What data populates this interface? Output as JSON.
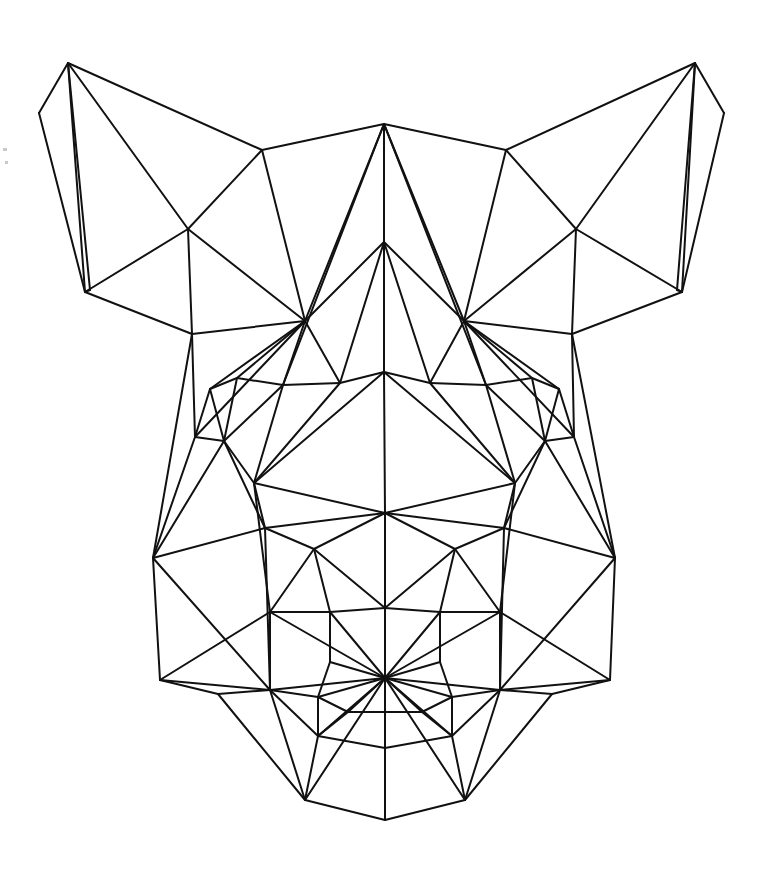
{
  "artwork": {
    "title": "Geometric Low-Poly Animal Head",
    "subject": "fox-dog-head",
    "style": "triangulated-line-art",
    "canvas": {
      "width": 757,
      "height": 884
    },
    "background_color": "#ffffff",
    "stroke_color": "#111111",
    "stroke_width": 2,
    "symmetry": "bilateral-vertical",
    "symmetry_axis_x": 384
  },
  "geometry": {
    "vertices": {
      "ear_l_tip": [
        68,
        63
      ],
      "ear_l_out_low": [
        39,
        113
      ],
      "ear_l_bottom": [
        85,
        292
      ],
      "ear_l_inner": [
        188,
        229
      ],
      "ear_l_base_in": [
        192,
        334
      ],
      "ear_l_fold": [
        90,
        290
      ],
      "ear_r_tip": [
        695,
        63
      ],
      "ear_r_out_low": [
        724,
        113
      ],
      "ear_r_bottom": [
        682,
        292
      ],
      "ear_r_inner": [
        576,
        229
      ],
      "ear_r_base_in": [
        572,
        334
      ],
      "ear_r_fold": [
        677,
        290
      ],
      "crown_top": [
        384,
        124
      ],
      "crown_l": [
        262,
        150
      ],
      "crown_r": [
        506,
        150
      ],
      "brow_l_hub": [
        305,
        321
      ],
      "brow_r_hub": [
        464,
        321
      ],
      "bridge_top": [
        384,
        242
      ],
      "bridge_mid": [
        384,
        372
      ],
      "brow_l_in": [
        340,
        383
      ],
      "brow_r_in": [
        430,
        383
      ],
      "eye_l_top": [
        237,
        378
      ],
      "eye_l_out": [
        210,
        389
      ],
      "eye_l_in": [
        283,
        385
      ],
      "eye_l_low": [
        224,
        441
      ],
      "eye_r_top": [
        532,
        378
      ],
      "eye_r_out": [
        559,
        389
      ],
      "eye_r_in": [
        486,
        385
      ],
      "eye_r_low": [
        545,
        441
      ],
      "cheek_l_up": [
        195,
        437
      ],
      "cheek_r_up": [
        574,
        437
      ],
      "cheek_l_mid": [
        254,
        483
      ],
      "cheek_r_mid": [
        515,
        483
      ],
      "jaw_l_corner": [
        153,
        558
      ],
      "jaw_r_corner": [
        615,
        558
      ],
      "muzzle_l_up": [
        265,
        528
      ],
      "muzzle_r_up": [
        504,
        528
      ],
      "face_center": [
        385,
        513
      ],
      "cheek_l_low": [
        314,
        549
      ],
      "cheek_r_low": [
        455,
        549
      ],
      "muzzle_l": [
        270,
        612
      ],
      "muzzle_r": [
        500,
        612
      ],
      "muzzle_l_hub": [
        270,
        690
      ],
      "muzzle_r_hub": [
        500,
        690
      ],
      "snout_l_up": [
        330,
        612
      ],
      "snout_r_up": [
        440,
        612
      ],
      "snout_l": [
        330,
        662
      ],
      "snout_r": [
        440,
        662
      ],
      "nose_hub": [
        385,
        678
      ],
      "nose_l_wing": [
        318,
        697
      ],
      "nose_r_wing": [
        452,
        697
      ],
      "nose_top": [
        385,
        608
      ],
      "jaw_l_low": [
        160,
        680
      ],
      "jaw_r_low": [
        610,
        680
      ],
      "jaw_l_in": [
        218,
        694
      ],
      "jaw_r_in": [
        552,
        694
      ],
      "lip_l": [
        318,
        736
      ],
      "lip_r": [
        452,
        736
      ],
      "chin_l": [
        305,
        800
      ],
      "chin_r": [
        465,
        800
      ],
      "chin_bottom": [
        385,
        820
      ],
      "chin_center": [
        385,
        748
      ],
      "mouth_l": [
        348,
        712
      ],
      "mouth_r": [
        422,
        712
      ]
    },
    "edges": [
      [
        "ear_l_tip",
        "ear_l_out_low"
      ],
      [
        "ear_l_out_low",
        "ear_l_bottom"
      ],
      [
        "ear_l_tip",
        "ear_l_bottom"
      ],
      [
        "ear_l_tip",
        "ear_l_fold"
      ],
      [
        "ear_l_tip",
        "ear_l_inner"
      ],
      [
        "ear_l_tip",
        "crown_l"
      ],
      [
        "ear_l_bottom",
        "ear_l_inner"
      ],
      [
        "ear_l_inner",
        "crown_l"
      ],
      [
        "ear_l_bottom",
        "ear_l_base_in"
      ],
      [
        "ear_l_inner",
        "ear_l_base_in"
      ],
      [
        "ear_l_base_in",
        "brow_l_hub"
      ],
      [
        "ear_l_inner",
        "brow_l_hub"
      ],
      [
        "crown_l",
        "brow_l_hub"
      ],
      [
        "crown_l",
        "crown_top"
      ],
      [
        "ear_r_tip",
        "ear_r_out_low"
      ],
      [
        "ear_r_out_low",
        "ear_r_bottom"
      ],
      [
        "ear_r_tip",
        "ear_r_bottom"
      ],
      [
        "ear_r_tip",
        "ear_r_fold"
      ],
      [
        "ear_r_tip",
        "ear_r_inner"
      ],
      [
        "ear_r_tip",
        "crown_r"
      ],
      [
        "ear_r_bottom",
        "ear_r_inner"
      ],
      [
        "ear_r_inner",
        "crown_r"
      ],
      [
        "ear_r_bottom",
        "ear_r_base_in"
      ],
      [
        "ear_r_inner",
        "ear_r_base_in"
      ],
      [
        "ear_r_base_in",
        "brow_r_hub"
      ],
      [
        "ear_r_inner",
        "brow_r_hub"
      ],
      [
        "crown_r",
        "brow_r_hub"
      ],
      [
        "crown_r",
        "crown_top"
      ],
      [
        "crown_top",
        "bridge_top"
      ],
      [
        "crown_top",
        "brow_l_hub"
      ],
      [
        "crown_top",
        "brow_r_hub"
      ],
      [
        "crown_top",
        "eye_l_in"
      ],
      [
        "crown_top",
        "eye_r_in"
      ],
      [
        "bridge_top",
        "bridge_mid"
      ],
      [
        "bridge_top",
        "brow_l_in"
      ],
      [
        "bridge_top",
        "brow_r_in"
      ],
      [
        "bridge_top",
        "brow_l_hub"
      ],
      [
        "bridge_top",
        "brow_r_hub"
      ],
      [
        "bridge_mid",
        "brow_l_in"
      ],
      [
        "bridge_mid",
        "brow_r_in"
      ],
      [
        "bridge_mid",
        "face_center"
      ],
      [
        "bridge_mid",
        "cheek_l_mid"
      ],
      [
        "bridge_mid",
        "cheek_r_mid"
      ],
      [
        "brow_l_hub",
        "eye_l_top"
      ],
      [
        "brow_l_hub",
        "eye_l_in"
      ],
      [
        "brow_l_hub",
        "eye_l_out"
      ],
      [
        "brow_l_hub",
        "cheek_l_up"
      ],
      [
        "brow_r_hub",
        "eye_r_top"
      ],
      [
        "brow_r_hub",
        "eye_r_in"
      ],
      [
        "brow_r_hub",
        "eye_r_out"
      ],
      [
        "brow_r_hub",
        "cheek_r_up"
      ],
      [
        "eye_l_top",
        "eye_l_in"
      ],
      [
        "eye_l_top",
        "eye_l_out"
      ],
      [
        "eye_l_top",
        "eye_l_low"
      ],
      [
        "eye_l_in",
        "eye_l_low"
      ],
      [
        "eye_l_out",
        "eye_l_low"
      ],
      [
        "eye_l_in",
        "brow_l_in"
      ],
      [
        "eye_l_in",
        "cheek_l_mid"
      ],
      [
        "eye_l_out",
        "cheek_l_up"
      ],
      [
        "eye_r_top",
        "eye_r_in"
      ],
      [
        "eye_r_top",
        "eye_r_out"
      ],
      [
        "eye_r_top",
        "eye_r_low"
      ],
      [
        "eye_r_in",
        "eye_r_low"
      ],
      [
        "eye_r_out",
        "eye_r_low"
      ],
      [
        "eye_r_in",
        "brow_r_in"
      ],
      [
        "eye_r_in",
        "cheek_r_mid"
      ],
      [
        "eye_r_out",
        "cheek_r_up"
      ],
      [
        "brow_l_in",
        "cheek_l_mid"
      ],
      [
        "brow_r_in",
        "cheek_r_mid"
      ],
      [
        "cheek_l_up",
        "eye_l_low"
      ],
      [
        "cheek_r_up",
        "eye_r_low"
      ],
      [
        "cheek_l_up",
        "jaw_l_corner"
      ],
      [
        "cheek_r_up",
        "jaw_r_corner"
      ],
      [
        "eye_l_low",
        "cheek_l_mid"
      ],
      [
        "eye_r_low",
        "cheek_r_mid"
      ],
      [
        "eye_l_low",
        "muzzle_l_up"
      ],
      [
        "eye_r_low",
        "muzzle_r_up"
      ],
      [
        "cheek_l_mid",
        "muzzle_l_up"
      ],
      [
        "cheek_r_mid",
        "muzzle_r_up"
      ],
      [
        "cheek_l_mid",
        "face_center"
      ],
      [
        "cheek_r_mid",
        "face_center"
      ],
      [
        "jaw_l_corner",
        "muzzle_l_up"
      ],
      [
        "jaw_r_corner",
        "muzzle_r_up"
      ],
      [
        "jaw_l_corner",
        "jaw_l_low"
      ],
      [
        "jaw_r_corner",
        "jaw_r_low"
      ],
      [
        "jaw_l_corner",
        "muzzle_l_hub"
      ],
      [
        "jaw_r_corner",
        "muzzle_r_hub"
      ],
      [
        "muzzle_l_up",
        "face_center"
      ],
      [
        "muzzle_r_up",
        "face_center"
      ],
      [
        "muzzle_l_up",
        "cheek_l_low"
      ],
      [
        "muzzle_r_up",
        "cheek_r_low"
      ],
      [
        "muzzle_l_up",
        "muzzle_l_hub"
      ],
      [
        "muzzle_r_up",
        "muzzle_r_hub"
      ],
      [
        "face_center",
        "cheek_l_low"
      ],
      [
        "face_center",
        "cheek_r_low"
      ],
      [
        "face_center",
        "nose_top"
      ],
      [
        "face_center",
        "nose_hub"
      ],
      [
        "cheek_l_low",
        "muzzle_l"
      ],
      [
        "cheek_r_low",
        "muzzle_r"
      ],
      [
        "cheek_l_low",
        "snout_l_up"
      ],
      [
        "cheek_r_low",
        "snout_r_up"
      ],
      [
        "cheek_l_low",
        "nose_top"
      ],
      [
        "cheek_r_low",
        "nose_top"
      ],
      [
        "nose_top",
        "snout_l_up"
      ],
      [
        "nose_top",
        "snout_r_up"
      ],
      [
        "muzzle_l",
        "snout_l_up"
      ],
      [
        "muzzle_r",
        "snout_r_up"
      ],
      [
        "muzzle_l",
        "muzzle_l_hub"
      ],
      [
        "muzzle_r",
        "muzzle_r_hub"
      ],
      [
        "muzzle_l",
        "nose_hub"
      ],
      [
        "muzzle_r",
        "nose_hub"
      ],
      [
        "snout_l_up",
        "snout_l"
      ],
      [
        "snout_r_up",
        "snout_r"
      ],
      [
        "snout_l_up",
        "nose_hub"
      ],
      [
        "snout_r_up",
        "nose_hub"
      ],
      [
        "snout_l",
        "nose_hub"
      ],
      [
        "snout_r",
        "nose_hub"
      ],
      [
        "snout_l",
        "nose_l_wing"
      ],
      [
        "snout_r",
        "nose_r_wing"
      ],
      [
        "muzzle_l_hub",
        "nose_l_wing"
      ],
      [
        "muzzle_r_hub",
        "nose_r_wing"
      ],
      [
        "muzzle_l_hub",
        "nose_hub"
      ],
      [
        "muzzle_r_hub",
        "nose_hub"
      ],
      [
        "nose_l_wing",
        "nose_hub"
      ],
      [
        "nose_r_wing",
        "nose_hub"
      ],
      [
        "muzzle_l_hub",
        "jaw_l_low"
      ],
      [
        "muzzle_r_hub",
        "jaw_r_low"
      ],
      [
        "muzzle_l_hub",
        "jaw_l_in"
      ],
      [
        "muzzle_r_hub",
        "jaw_r_in"
      ],
      [
        "jaw_l_low",
        "jaw_l_in"
      ],
      [
        "jaw_r_low",
        "jaw_r_in"
      ],
      [
        "jaw_l_in",
        "chin_l"
      ],
      [
        "jaw_r_in",
        "chin_r"
      ],
      [
        "muzzle_l_hub",
        "lip_l"
      ],
      [
        "muzzle_r_hub",
        "lip_r"
      ],
      [
        "muzzle_l_hub",
        "chin_l"
      ],
      [
        "muzzle_r_hub",
        "chin_r"
      ],
      [
        "nose_hub",
        "mouth_l"
      ],
      [
        "nose_hub",
        "mouth_r"
      ],
      [
        "nose_hub",
        "lip_l"
      ],
      [
        "nose_hub",
        "lip_r"
      ],
      [
        "nose_hub",
        "chin_center"
      ],
      [
        "nose_hub",
        "chin_l"
      ],
      [
        "nose_hub",
        "chin_r"
      ],
      [
        "nose_hub",
        "chin_bottom"
      ],
      [
        "mouth_l",
        "lip_l"
      ],
      [
        "mouth_r",
        "lip_r"
      ],
      [
        "mouth_l",
        "mouth_r"
      ],
      [
        "lip_l",
        "chin_center"
      ],
      [
        "lip_r",
        "chin_center"
      ],
      [
        "lip_l",
        "chin_l"
      ],
      [
        "lip_r",
        "chin_r"
      ],
      [
        "chin_center",
        "chin_bottom"
      ],
      [
        "chin_l",
        "chin_bottom"
      ],
      [
        "chin_r",
        "chin_bottom"
      ],
      [
        "nose_l_wing",
        "lip_l"
      ],
      [
        "nose_r_wing",
        "lip_r"
      ],
      [
        "nose_l_wing",
        "mouth_l"
      ],
      [
        "nose_r_wing",
        "mouth_r"
      ],
      [
        "ear_l_base_in",
        "jaw_l_corner"
      ],
      [
        "ear_r_base_in",
        "jaw_r_corner"
      ],
      [
        "ear_l_base_in",
        "cheek_l_up"
      ],
      [
        "ear_r_base_in",
        "cheek_r_up"
      ],
      [
        "brow_l_hub",
        "brow_l_in"
      ],
      [
        "brow_r_hub",
        "brow_r_in"
      ],
      [
        "ear_l_fold",
        "ear_l_bottom"
      ],
      [
        "ear_r_fold",
        "ear_r_bottom"
      ],
      [
        "eye_l_low",
        "jaw_l_corner"
      ],
      [
        "eye_r_low",
        "jaw_r_corner"
      ],
      [
        "cheek_l_mid",
        "muzzle_l"
      ],
      [
        "cheek_r_mid",
        "muzzle_r"
      ],
      [
        "muzzle_l",
        "jaw_l_low"
      ],
      [
        "muzzle_r",
        "jaw_r_low"
      ]
    ]
  },
  "specks": [
    {
      "x": 3,
      "y": 148,
      "w": 4,
      "h": 3
    },
    {
      "x": 5,
      "y": 161,
      "w": 3,
      "h": 3
    }
  ]
}
